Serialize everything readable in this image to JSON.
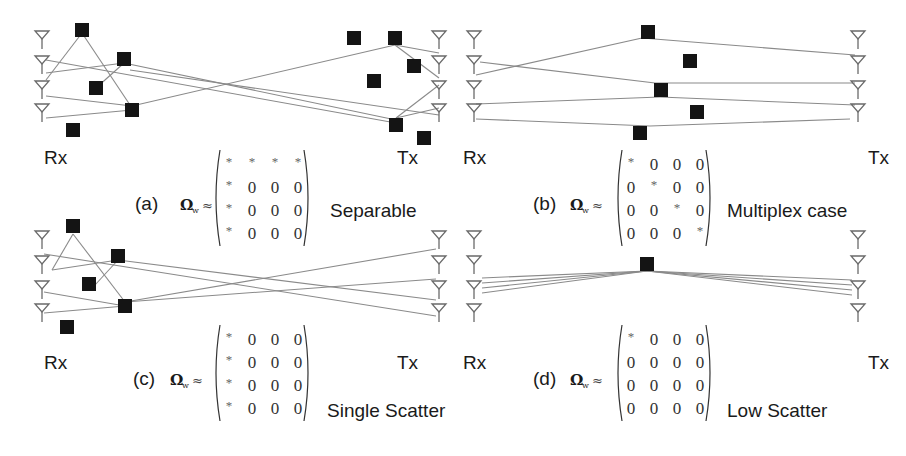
{
  "figure": {
    "panels": [
      {
        "id": "a",
        "tag": "(a)",
        "case_label": "Separable",
        "rx_label": "Rx",
        "tx_label": "Tx",
        "rx_label_pos": [
          44,
          164
        ],
        "tx_label_pos": [
          397,
          164
        ],
        "rx_antennas": [
          [
            42,
            40
          ],
          [
            42,
            65
          ],
          [
            42,
            90
          ],
          [
            42,
            113
          ]
        ],
        "tx_antennas": [
          [
            439,
            40
          ],
          [
            439,
            65
          ],
          [
            439,
            90
          ],
          [
            439,
            113
          ]
        ],
        "scatterers": [
          [
            82,
            30
          ],
          [
            124,
            59
          ],
          [
            96,
            88
          ],
          [
            132,
            110
          ],
          [
            73,
            130
          ],
          [
            354,
            38
          ],
          [
            395,
            38
          ],
          [
            414,
            66
          ],
          [
            374,
            81
          ],
          [
            396,
            125
          ],
          [
            424,
            138
          ]
        ],
        "rays": [
          [
            [
              46,
              80
            ],
            [
              82,
              33
            ]
          ],
          [
            [
              82,
              33
            ],
            [
              132,
              108
            ]
          ],
          [
            [
              46,
              73
            ],
            [
              124,
              63
            ]
          ],
          [
            [
              124,
              63
            ],
            [
              96,
              88
            ]
          ],
          [
            [
              46,
              96
            ],
            [
              132,
              106
            ]
          ],
          [
            [
              46,
              118
            ],
            [
              132,
              110
            ]
          ],
          [
            [
              132,
              106
            ],
            [
              395,
              45
            ]
          ],
          [
            [
              46,
              60
            ],
            [
              396,
              123
            ]
          ],
          [
            [
              124,
              63
            ],
            [
              396,
              120
            ]
          ],
          [
            [
              130,
              70
            ],
            [
              439,
              115
            ]
          ],
          [
            [
              395,
              45
            ],
            [
              439,
              53
            ]
          ],
          [
            [
              395,
              45
            ],
            [
              439,
              78
            ]
          ],
          [
            [
              396,
              118
            ],
            [
              439,
              85
            ]
          ],
          [
            [
              396,
              118
            ],
            [
              439,
              108
            ]
          ]
        ],
        "formula": {
          "tag_pos": [
            135,
            210
          ],
          "omega_pos": [
            180,
            210
          ],
          "matrix_x": 212,
          "matrix_y": 150
        },
        "matrix": [
          [
            "*",
            "*",
            "*",
            "*"
          ],
          [
            "*",
            "0",
            "0",
            "0"
          ],
          [
            "*",
            "0",
            "0",
            "0"
          ],
          [
            "*",
            "0",
            "0",
            "0"
          ]
        ],
        "case_label_pos": [
          330,
          217
        ]
      },
      {
        "id": "b",
        "tag": "(b)",
        "case_label": "Multiplex case",
        "rx_label": "Rx",
        "tx_label": "Tx",
        "rx_label_pos": [
          463,
          164
        ],
        "tx_label_pos": [
          868,
          164
        ],
        "rx_antennas": [
          [
            474,
            40
          ],
          [
            474,
            65
          ],
          [
            474,
            90
          ],
          [
            474,
            113
          ]
        ],
        "tx_antennas": [
          [
            858,
            40
          ],
          [
            858,
            65
          ],
          [
            858,
            90
          ],
          [
            858,
            113
          ]
        ],
        "scatterers": [
          [
            648,
            32
          ],
          [
            690,
            61
          ],
          [
            661,
            90
          ],
          [
            697,
            112
          ],
          [
            640,
            133
          ]
        ],
        "rays": [
          [
            [
              476,
              75
            ],
            [
              642,
              38
            ]
          ],
          [
            [
              642,
              38
            ],
            [
              855,
              55
            ]
          ],
          [
            [
              480,
              62
            ],
            [
              655,
              83
            ]
          ],
          [
            [
              655,
              83
            ],
            [
              855,
              83
            ]
          ],
          [
            [
              476,
              104
            ],
            [
              660,
              97
            ]
          ],
          [
            [
              660,
              97
            ],
            [
              855,
              105
            ]
          ],
          [
            [
              476,
              119
            ],
            [
              650,
              126
            ]
          ],
          [
            [
              650,
              126
            ],
            [
              850,
              119
            ]
          ]
        ],
        "formula": {
          "tag_pos": [
            533,
            210
          ],
          "omega_pos": [
            570,
            210
          ],
          "matrix_x": 614,
          "matrix_y": 150
        },
        "matrix": [
          [
            "*",
            "0",
            "0",
            "0"
          ],
          [
            "0",
            "*",
            "0",
            "0"
          ],
          [
            "0",
            "0",
            "*",
            "0"
          ],
          [
            "0",
            "0",
            "0",
            "*"
          ]
        ],
        "case_label_pos": [
          727,
          217
        ]
      },
      {
        "id": "c",
        "tag": "(c)",
        "case_label": "Single Scatter",
        "rx_label": "Rx",
        "tx_label": "Tx",
        "rx_label_pos": [
          44,
          369
        ],
        "tx_label_pos": [
          397,
          369
        ],
        "rx_antennas": [
          [
            42,
            240
          ],
          [
            42,
            265
          ],
          [
            42,
            290
          ],
          [
            42,
            313
          ]
        ],
        "tx_antennas": [
          [
            439,
            240
          ],
          [
            439,
            265
          ],
          [
            439,
            290
          ],
          [
            439,
            313
          ]
        ],
        "scatterers": [
          [
            73,
            226
          ],
          [
            118,
            256
          ],
          [
            89,
            284
          ],
          [
            125,
            306
          ],
          [
            67,
            327
          ]
        ],
        "rays": [
          [
            [
              52,
              270
            ],
            [
              73,
              234
            ]
          ],
          [
            [
              73,
              234
            ],
            [
              125,
              302
            ]
          ],
          [
            [
              52,
              270
            ],
            [
              118,
              260
            ]
          ],
          [
            [
              118,
              260
            ],
            [
              95,
              285
            ]
          ],
          [
            [
              44,
              254
            ],
            [
              436,
              316
            ]
          ],
          [
            [
              118,
              260
            ],
            [
              436,
              300
            ]
          ],
          [
            [
              44,
              292
            ],
            [
              125,
              306
            ]
          ],
          [
            [
              44,
              313
            ],
            [
              125,
              306
            ]
          ],
          [
            [
              125,
              302
            ],
            [
              436,
              249
            ]
          ],
          [
            [
              125,
              302
            ],
            [
              436,
              279
            ]
          ]
        ],
        "formula": {
          "tag_pos": [
            133,
            385
          ],
          "omega_pos": [
            170,
            385
          ],
          "matrix_x": 212,
          "matrix_y": 325
        },
        "matrix": [
          [
            "*",
            "0",
            "0",
            "0"
          ],
          [
            "*",
            "0",
            "0",
            "0"
          ],
          [
            "*",
            "0",
            "0",
            "0"
          ],
          [
            "*",
            "0",
            "0",
            "0"
          ]
        ],
        "case_label_pos": [
          327,
          417
        ]
      },
      {
        "id": "d",
        "tag": "(d)",
        "case_label": "Low Scatter",
        "rx_label": "Rx",
        "tx_label": "Tx",
        "rx_label_pos": [
          463,
          369
        ],
        "tx_label_pos": [
          868,
          369
        ],
        "rx_antennas": [
          [
            474,
            240
          ],
          [
            474,
            265
          ],
          [
            474,
            290
          ],
          [
            474,
            313
          ]
        ],
        "tx_antennas": [
          [
            858,
            240
          ],
          [
            858,
            265
          ],
          [
            858,
            290
          ],
          [
            858,
            313
          ]
        ],
        "scatterers": [
          [
            647,
            264
          ]
        ],
        "rays": [
          [
            [
              482,
              278
            ],
            [
              647,
              271
            ]
          ],
          [
            [
              482,
              283
            ],
            [
              647,
              271
            ]
          ],
          [
            [
              482,
              288
            ],
            [
              647,
              271
            ]
          ],
          [
            [
              482,
              293
            ],
            [
              647,
              271
            ]
          ],
          [
            [
              647,
              271
            ],
            [
              852,
              280
            ]
          ],
          [
            [
              647,
              271
            ],
            [
              852,
              285
            ]
          ],
          [
            [
              647,
              271
            ],
            [
              852,
              290
            ]
          ],
          [
            [
              647,
              271
            ],
            [
              852,
              295
            ]
          ]
        ],
        "formula": {
          "tag_pos": [
            533,
            385
          ],
          "omega_pos": [
            570,
            385
          ],
          "matrix_x": 614,
          "matrix_y": 325
        },
        "matrix": [
          [
            "*",
            "0",
            "0",
            "0"
          ],
          [
            "0",
            "0",
            "0",
            "0"
          ],
          [
            "0",
            "0",
            "0",
            "0"
          ],
          [
            "0",
            "0",
            "0",
            "0"
          ]
        ],
        "case_label_pos": [
          727,
          417
        ]
      }
    ],
    "omega_symbol": "Ω",
    "omega_subscript": "w",
    "approx_symbol": "≈",
    "colors": {
      "scatterer": "#141414",
      "ray": "#8a8a8a",
      "antenna": "#6a6a6a",
      "text": "#1a1a1a"
    }
  }
}
